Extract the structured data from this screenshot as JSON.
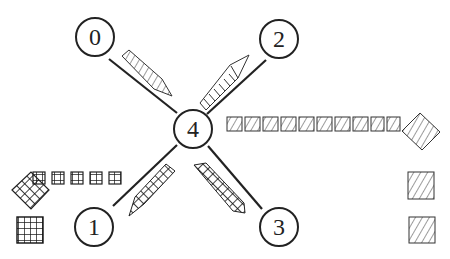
{
  "diagram": {
    "type": "star-topology-message-passing",
    "center_node": {
      "id": "4",
      "label": "4",
      "x": 193,
      "y": 129
    },
    "nodes": [
      {
        "id": "0",
        "label": "0",
        "x": 95,
        "y": 37
      },
      {
        "id": "2",
        "label": "2",
        "x": 279,
        "y": 39
      },
      {
        "id": "1",
        "label": "1",
        "x": 94,
        "y": 227
      },
      {
        "id": "3",
        "label": "3",
        "x": 279,
        "y": 227
      }
    ],
    "edges": [
      {
        "from": "4",
        "to": "0"
      },
      {
        "from": "4",
        "to": "2"
      },
      {
        "from": "4",
        "to": "1"
      },
      {
        "from": "4",
        "to": "3"
      }
    ],
    "messages": [
      {
        "edge": "0-4",
        "pattern": "diagonal-lines",
        "direction": "toward-4"
      },
      {
        "edge": "4-2",
        "pattern": "horizontal-lines",
        "direction": "toward-2"
      },
      {
        "edge": "1-4",
        "pattern": "crosshatch",
        "direction": "toward-4"
      },
      {
        "edge": "4-3",
        "pattern": "crosshatch",
        "direction": "toward-4"
      }
    ],
    "right_stream": {
      "count_small_squares": 11,
      "pattern": "diagonal-lines",
      "end": "rotated-square"
    },
    "left_stream": {
      "count_small_squares": 5,
      "pattern": "grid",
      "end": "rotated-grid-square"
    },
    "right_stack": {
      "count": 2,
      "pattern": "diagonal-lines"
    },
    "left_stack": {
      "count": 1,
      "pattern": "grid"
    },
    "colors": {
      "stroke": "#222222",
      "background": "#ffffff"
    }
  }
}
